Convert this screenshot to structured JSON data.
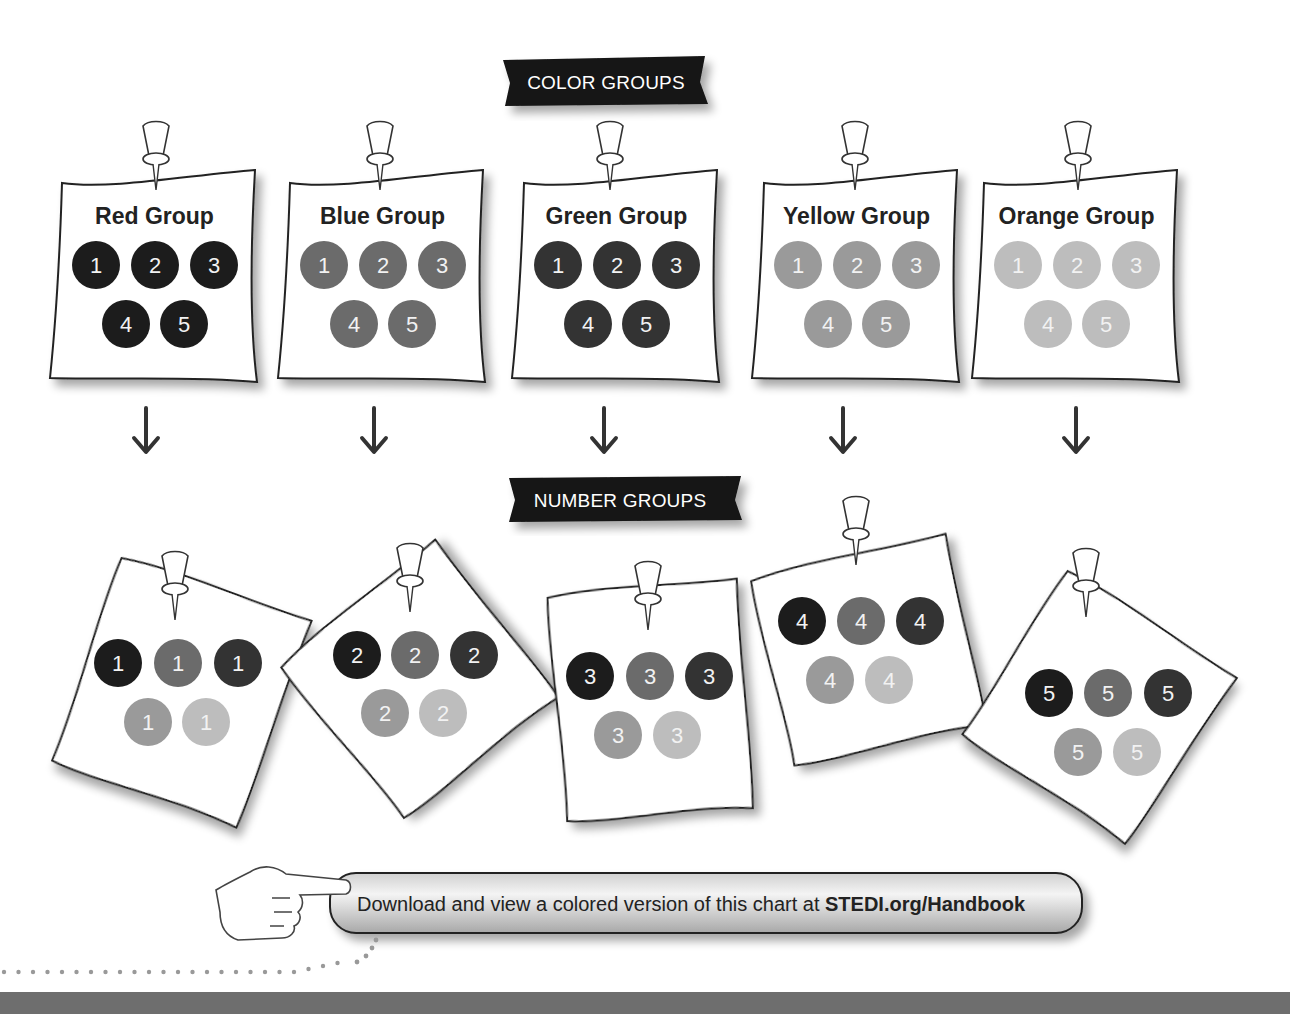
{
  "banners": {
    "color_groups": "COLOR GROUPS",
    "number_groups": "NUMBER GROUPS"
  },
  "colors": {
    "red": "#1c1c1c",
    "blue": "#6b6b6b",
    "green": "#333333",
    "yellow": "#9a9a9a",
    "orange": "#bdbdbd",
    "banner_bg": "#141414",
    "footer_bar": "#6e6e6e"
  },
  "color_groups": [
    {
      "title": "Red Group",
      "color_key": "red",
      "dots": [
        "1",
        "2",
        "3",
        "4",
        "5"
      ]
    },
    {
      "title": "Blue Group",
      "color_key": "blue",
      "dots": [
        "1",
        "2",
        "3",
        "4",
        "5"
      ]
    },
    {
      "title": "Green Group",
      "color_key": "green",
      "dots": [
        "1",
        "2",
        "3",
        "4",
        "5"
      ]
    },
    {
      "title": "Yellow Group",
      "color_key": "yellow",
      "dots": [
        "1",
        "2",
        "3",
        "4",
        "5"
      ]
    },
    {
      "title": "Orange Group",
      "color_key": "orange",
      "dots": [
        "1",
        "2",
        "3",
        "4",
        "5"
      ]
    }
  ],
  "arrows": [
    "down-arrow",
    "down-arrow",
    "down-arrow",
    "down-arrow",
    "down-arrow"
  ],
  "number_groups": [
    {
      "number": "1",
      "dot_colors": [
        "red",
        "blue",
        "green",
        "yellow",
        "orange"
      ]
    },
    {
      "number": "2",
      "dot_colors": [
        "red",
        "blue",
        "green",
        "yellow",
        "orange"
      ]
    },
    {
      "number": "3",
      "dot_colors": [
        "red",
        "blue",
        "green",
        "yellow",
        "orange"
      ]
    },
    {
      "number": "4",
      "dot_colors": [
        "red",
        "blue",
        "green",
        "yellow",
        "orange"
      ]
    },
    {
      "number": "5",
      "dot_colors": [
        "red",
        "blue",
        "green",
        "yellow",
        "orange"
      ]
    }
  ],
  "cta": {
    "text": "Download and view a colored version of this chart at ",
    "link": "STEDI.org/Handbook"
  }
}
